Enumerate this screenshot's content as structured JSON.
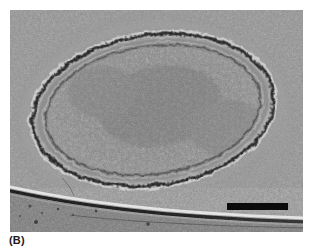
{
  "figure": {
    "panel_label": "(B)",
    "image_kind": "cryo-electron-micrograph",
    "background_color": "#8c8c8c",
    "ink_color": "#0b0b0b",
    "plate": {
      "left": 10,
      "top": 10,
      "width": 293,
      "height": 222
    },
    "scale_bar": {
      "label": "",
      "left": 217,
      "top": 193,
      "width": 61,
      "height": 7,
      "color": "#0b0b0b"
    },
    "cell": {
      "center_x": 152,
      "center_y": 110,
      "radius_x": 128,
      "radius_y": 80,
      "rotation_deg": -8,
      "envelope_layers": [
        "outer-membrane-scalloped",
        "periplasm",
        "inner-membrane"
      ],
      "cytoplasm_texture": "dense-granular-ribosomes",
      "nucleoid_texture": "condensed-fibrillar"
    },
    "support_film_edge": {
      "description": "carbon film edge, bright line above dark line, curving left-to-right across lower portion",
      "bright_color": "#e8e8e8",
      "dark_color": "#0d0d0d"
    }
  }
}
